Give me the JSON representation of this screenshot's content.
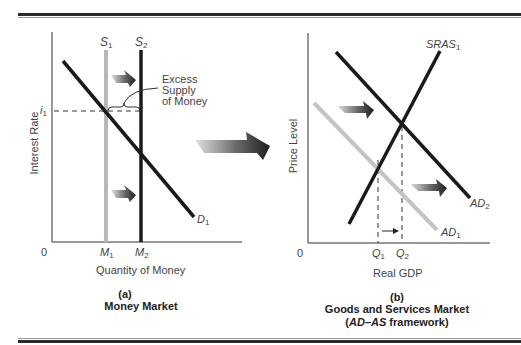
{
  "panel_a": {
    "letter": "(a)",
    "title": "Money Market",
    "x_axis_label": "Quantity of Money",
    "y_axis_label": "Interest Rate",
    "origin": "0",
    "curves": {
      "s1": {
        "name": "S",
        "sub": "1",
        "color": "#b8b8b8"
      },
      "s2": {
        "name": "S",
        "sub": "2",
        "color": "#1a1a1a"
      },
      "d1": {
        "name": "D",
        "sub": "1",
        "color": "#1a1a1a"
      }
    },
    "tick_y": {
      "name": "i",
      "sub": "1"
    },
    "ticks_x": [
      {
        "name": "M",
        "sub": "1"
      },
      {
        "name": "M",
        "sub": "2"
      }
    ],
    "annotation": [
      "Excess",
      "Supply",
      "of Money"
    ]
  },
  "panel_b": {
    "letter": "(b)",
    "title": "Goods and Services Market",
    "subtitle_italic": "AD–AS",
    "subtitle_rest": " framework)",
    "subtitle_open": "(",
    "x_axis_label": "Real GDP",
    "y_axis_label": "Price Level",
    "origin": "0",
    "curves": {
      "sras1": {
        "name": "SRAS",
        "sub": "1",
        "color": "#1a1a1a"
      },
      "ad1": {
        "name": "AD",
        "sub": "1",
        "color": "#c4c4c4"
      },
      "ad2": {
        "name": "AD",
        "sub": "2",
        "color": "#1a1a1a"
      }
    },
    "ticks_x": [
      {
        "name": "Q",
        "sub": "1"
      },
      {
        "name": "Q",
        "sub": "2"
      }
    ]
  },
  "colors": {
    "rule": "#2a2a2a",
    "axis": "#333333",
    "arrow_dark": "#2a2a2a",
    "arrow_light": "#d0d0d0"
  }
}
